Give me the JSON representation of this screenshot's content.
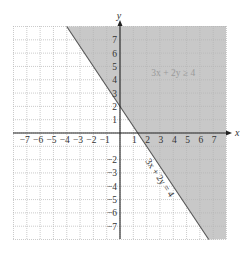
{
  "chart_data": {
    "type": "area",
    "title": "",
    "xlabel": "x",
    "ylabel": "y",
    "xlim": [
      -8,
      8
    ],
    "ylim": [
      -8,
      8
    ],
    "grid": true,
    "grid_style": "dotted",
    "x_ticks": [
      -7,
      -6,
      -5,
      -4,
      -3,
      -2,
      -1,
      1,
      2,
      3,
      4,
      5,
      6,
      7
    ],
    "y_ticks": [
      -7,
      -6,
      -5,
      -4,
      -3,
      -2,
      1,
      2,
      3,
      4,
      5,
      6,
      7
    ],
    "x_tick_labels": [
      "−7",
      "−6",
      "−5",
      "−4",
      "−3",
      "−2",
      "−1",
      "1",
      "2",
      "3",
      "4",
      "5",
      "6",
      "7"
    ],
    "y_tick_labels": [
      "−7",
      "−6",
      "−5",
      "−4",
      "−3",
      "−2",
      "1",
      "2",
      "3",
      "4",
      "5",
      "6",
      "7"
    ],
    "boundary_line": {
      "equation": "3x + 2y = 4",
      "style": "solid",
      "points": [
        [
          -4,
          8
        ],
        [
          6.667,
          -8
        ]
      ],
      "intercepts": {
        "x": 1.333,
        "y": 2
      }
    },
    "shaded_region": {
      "inequality": "3x + 2y ≥ 4",
      "side": "above-right of line",
      "color": "#c8c8c8"
    },
    "annotations": [
      {
        "text": "3x + 2y ≥ 4",
        "x": 4,
        "y": 4.5,
        "rotation": 0
      },
      {
        "text": "3x + 2y = 4",
        "x": 2.8,
        "y": -3.5,
        "rotation": 56
      }
    ],
    "legend": null
  },
  "labels": {
    "x_axis": "x",
    "y_axis": "y",
    "region_label": "3x + 2y ≥ 4",
    "line_label": "3x + 2y = 4"
  },
  "colors": {
    "shade": "#c8c8c8",
    "grid": "#b4b4b4",
    "axis": "#222222",
    "line": "#555555",
    "region_text": "#9a9a9a",
    "text": "#333333"
  }
}
